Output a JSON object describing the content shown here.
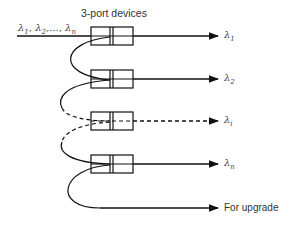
{
  "title": "3-port devices",
  "input_label": {
    "symbol": "λ",
    "text": "λ1, λ2,..., λn",
    "subs": [
      "1",
      "2",
      "n"
    ]
  },
  "outputs": [
    {
      "symbol": "λ",
      "sub": "1",
      "style": "solid"
    },
    {
      "symbol": "λ",
      "sub": "2",
      "style": "solid"
    },
    {
      "symbol": "λ",
      "sub": "i",
      "style": "dashed"
    },
    {
      "symbol": "λ",
      "sub": "n",
      "style": "solid"
    }
  ],
  "upgrade_label": "For upgrade",
  "colors": {
    "line": "#111111",
    "text": "#333333"
  }
}
